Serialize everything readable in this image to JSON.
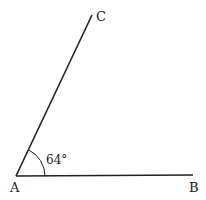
{
  "diagram": {
    "type": "angle",
    "vertex": {
      "label": "A",
      "x": 16,
      "y": 176
    },
    "ray1_end": {
      "label": "B",
      "x": 193,
      "y": 175
    },
    "ray2_end": {
      "label": "C",
      "x": 92,
      "y": 15
    },
    "angle": {
      "value": 64,
      "label": "64°",
      "between": [
        "AB",
        "AC"
      ]
    },
    "colors": {
      "line": "#222222",
      "background": "#ffffff"
    }
  }
}
